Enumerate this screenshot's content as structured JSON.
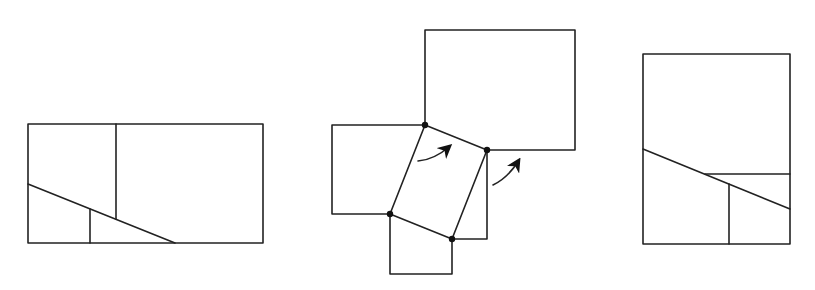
{
  "diagram": {
    "type": "geometric-dissection",
    "stroke_color": "#222222",
    "background": "#ffffff",
    "figures": [
      {
        "name": "rectangle-dissected",
        "outer": [
          28,
          124,
          263,
          243
        ],
        "lines": [
          [
            116,
            124,
            116,
            219
          ],
          [
            28,
            184,
            175,
            243
          ],
          [
            90,
            209,
            90,
            243
          ]
        ]
      },
      {
        "name": "squares-around-parallelogram",
        "dots": [
          [
            425,
            125
          ],
          [
            487,
            150
          ],
          [
            390,
            214
          ],
          [
            452,
            239
          ]
        ],
        "arrows": 2
      },
      {
        "name": "rectangle-reassembled",
        "outer": [
          643,
          54,
          790,
          244
        ],
        "lines": [
          [
            643,
            149,
            790,
            209
          ],
          [
            705,
            174,
            790,
            174
          ],
          [
            729,
            184,
            729,
            244
          ]
        ]
      }
    ]
  }
}
